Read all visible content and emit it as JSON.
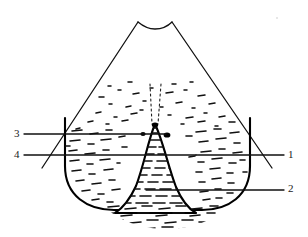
{
  "figure": {
    "background_color": "#ffffff",
    "ink_color": "#000000",
    "width": 308,
    "height": 237
  },
  "labels": [
    {
      "id": "label-1",
      "text": "1",
      "side": "right",
      "leader_y": 155
    },
    {
      "id": "label-2",
      "text": "2",
      "side": "right",
      "leader_y": 190
    },
    {
      "id": "label-3",
      "text": "3",
      "side": "left",
      "leader_y": 134
    },
    {
      "id": "label-4",
      "text": "4",
      "side": "left",
      "leader_y": 155
    }
  ],
  "leader_lines": [
    {
      "name": "leader-line-1",
      "x1": 196,
      "y1": 155,
      "x2": 284,
      "y2": 155
    },
    {
      "name": "leader-line-2",
      "x1": 146,
      "y1": 190,
      "x2": 284,
      "y2": 190
    },
    {
      "name": "leader-line-3",
      "x1": 24,
      "y1": 134,
      "x2": 166,
      "y2": 134
    },
    {
      "name": "leader-line-4",
      "x1": 24,
      "y1": 155,
      "x2": 196,
      "y2": 155
    }
  ],
  "structures": {
    "outer_cone": {
      "name": "outer-cone-outline",
      "summit_notch": true,
      "apex_left_x": 138,
      "apex_right_x": 172,
      "apex_y": 22,
      "base_left_x": 42,
      "base_right_x": 272,
      "base_y": 165
    },
    "inner_bowl": {
      "name": "inner-bowl-chamber",
      "left_x": 65,
      "right_x": 250,
      "top_y": 130,
      "bottom_y": 205
    },
    "central_spike": {
      "name": "central-conduit-spike",
      "peak_x": 155,
      "peak_y": 124,
      "base_left_x": 124,
      "base_right_x": 190,
      "base_y": 208
    },
    "dotted_conduit": {
      "name": "dotted-conduit-lines",
      "left_x": 150,
      "right_x": 160,
      "top_y": 84,
      "bottom_y": 124
    }
  },
  "texture": {
    "name": "stipple-hatch-fill",
    "description": "short irregular dashes and dots filling the inner chamber and spike"
  }
}
